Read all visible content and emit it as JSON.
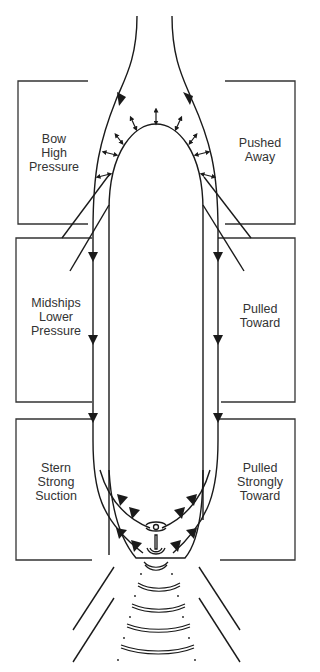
{
  "diagram": {
    "type": "ship hydrodynamic pressure zones",
    "colors": {
      "line": "#1a1a1a",
      "text": "#333333",
      "background": "#ffffff"
    },
    "zones": [
      {
        "id": "bow",
        "left_label": [
          "Bow",
          "High",
          "Pressure"
        ],
        "right_label": [
          "Pushed",
          "Away"
        ]
      },
      {
        "id": "midships",
        "left_label": [
          "Midships",
          "Lower",
          "Pressure"
        ],
        "right_label": [
          "Pulled",
          "Toward"
        ]
      },
      {
        "id": "stern",
        "left_label": [
          "Stern",
          "Strong",
          "Suction"
        ],
        "right_label": [
          "Pulled",
          "Strongly",
          "Toward"
        ]
      }
    ],
    "elements": [
      "hull-outline",
      "flow-streamlines",
      "pressure-arrows",
      "propeller",
      "rudder",
      "propeller-wash"
    ]
  }
}
